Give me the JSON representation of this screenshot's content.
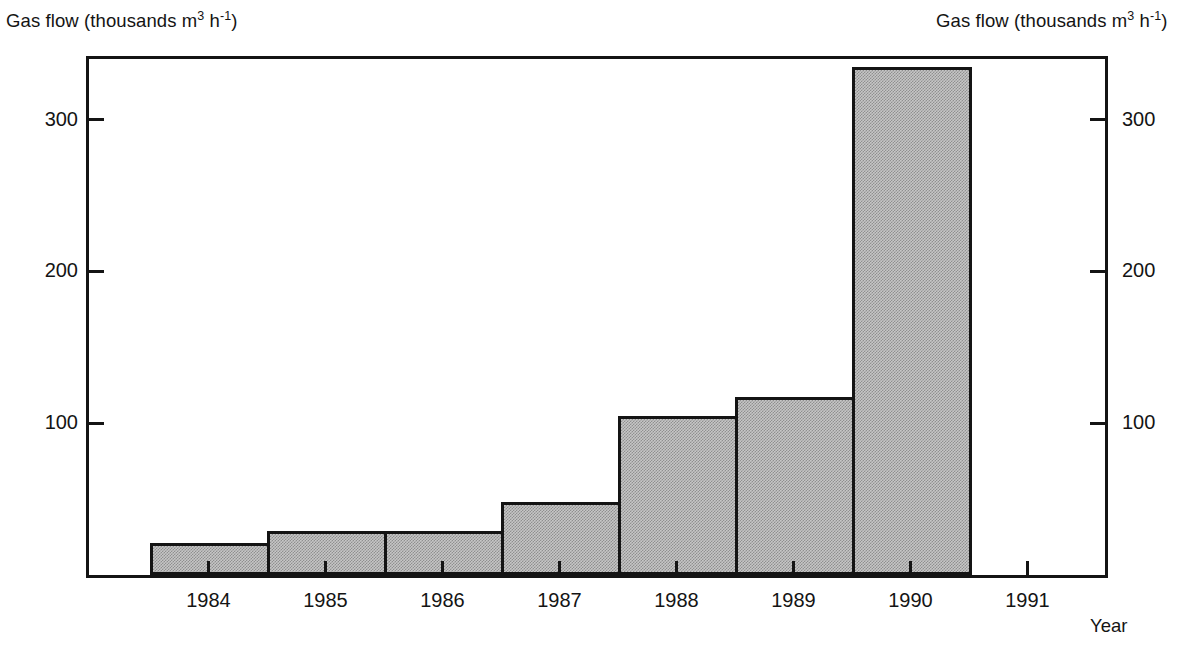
{
  "axis_titles": {
    "left": {
      "prefix": "Gas flow (thousands m",
      "sup1": "3",
      "mid": " h",
      "sup2": "-1",
      "suffix": ")"
    },
    "right": {
      "prefix": "Gas flow (thousands m",
      "sup1": "3",
      "mid": " h",
      "sup2": "-1",
      "suffix": ")"
    },
    "x": "Year"
  },
  "chart_data": {
    "type": "bar",
    "title": "",
    "xlabel": "Year",
    "ylabel": "Gas flow (thousands m3 h-1)",
    "ylabel_right": "Gas flow (thousands m3 h-1)",
    "categories": [
      "1984",
      "1985",
      "1986",
      "1987",
      "1988",
      "1989",
      "1990",
      "1991"
    ],
    "values": [
      21,
      29,
      29,
      48,
      105,
      117,
      335,
      null
    ],
    "ylim": [
      0,
      342
    ],
    "yticks": [
      100,
      200,
      300
    ],
    "ytick_labels_left": [
      "100",
      "200",
      "300"
    ],
    "ytick_labels_right": [
      "100",
      "200",
      "300"
    ],
    "xtick_labels": [
      "1984",
      "1985",
      "1986",
      "1987",
      "1988",
      "1989",
      "1990",
      "1991"
    ],
    "grid": false,
    "legend": null,
    "bar_fill": "#c6c6c6",
    "bar_edge": "#141414",
    "axis_color": "#141414",
    "background": "#ffffff"
  }
}
